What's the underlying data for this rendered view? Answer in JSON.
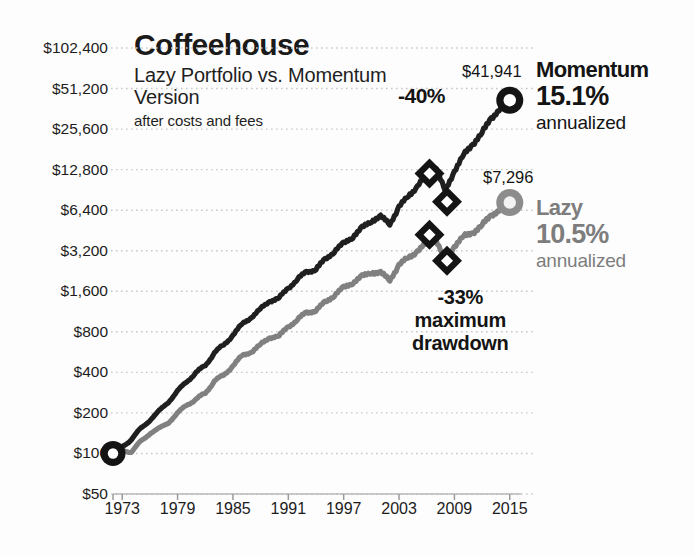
{
  "chart_data": {
    "type": "line",
    "title": "Coffeehouse",
    "subtitle": "Lazy Portfolio vs. Momentum Version",
    "note": "after costs and fees",
    "xlabel": "",
    "ylabel": "",
    "yscale": "log2",
    "ylim": [
      50,
      102400
    ],
    "xlim": [
      1972,
      2016
    ],
    "grid": true,
    "legend_position": "right",
    "y_tick_labels": [
      "$102,400",
      "$51,200",
      "$25,600",
      "$12,800",
      "$6,400",
      "$3,200",
      "$1,600",
      "$800",
      "$400",
      "$200",
      "$100",
      "$50"
    ],
    "y_tick_values": [
      102400,
      51200,
      25600,
      12800,
      6400,
      3200,
      1600,
      800,
      400,
      200,
      100,
      50
    ],
    "x_tick_labels": [
      "1973",
      "1979",
      "1985",
      "1991",
      "1997",
      "2003",
      "2009",
      "2015"
    ],
    "x_tick_values": [
      1973,
      1979,
      1985,
      1991,
      1997,
      2003,
      2009,
      2015
    ],
    "series": [
      {
        "name": "Momentum",
        "color": "#1f1f1f",
        "annualized": "15.1%",
        "end_value_label": "$41,941",
        "end_value": 41941,
        "start_value": 100,
        "max_drawdown_label": "-40%",
        "x": [
          1972,
          1973,
          1974,
          1975,
          1976,
          1977,
          1978,
          1979,
          1980,
          1981,
          1982,
          1983,
          1984,
          1985,
          1986,
          1987,
          1988,
          1989,
          1990,
          1991,
          1992,
          1993,
          1994,
          1995,
          1996,
          1997,
          1998,
          1999,
          2000,
          2001,
          2002,
          2003,
          2004,
          2005,
          2006,
          2007,
          2008,
          2009,
          2010,
          2011,
          2012,
          2013,
          2014,
          2015
        ],
        "values": [
          100,
          112,
          128,
          152,
          178,
          205,
          243,
          288,
          345,
          395,
          452,
          560,
          638,
          760,
          910,
          1030,
          1180,
          1360,
          1420,
          1700,
          1960,
          2240,
          2330,
          2760,
          3180,
          3620,
          4080,
          4720,
          5350,
          5700,
          5100,
          6700,
          8200,
          9600,
          11800,
          13000,
          8900,
          12500,
          16500,
          19800,
          24000,
          31000,
          36500,
          41941
        ]
      },
      {
        "name": "Lazy",
        "color": "#808080",
        "annualized": "10.5%",
        "end_value_label": "$7,296",
        "end_value": 7296,
        "start_value": 100,
        "max_drawdown_label": "-33%",
        "x": [
          1972,
          1973,
          1974,
          1975,
          1976,
          1977,
          1978,
          1979,
          1980,
          1981,
          1982,
          1983,
          1984,
          1985,
          1986,
          1987,
          1988,
          1989,
          1990,
          1991,
          1992,
          1993,
          1994,
          1995,
          1996,
          1997,
          1998,
          1999,
          2000,
          2001,
          2002,
          2003,
          2004,
          2005,
          2006,
          2007,
          2008,
          2009,
          2010,
          2011,
          2012,
          2013,
          2014,
          2015
        ],
        "values": [
          100,
          106,
          103,
          122,
          142,
          152,
          171,
          197,
          232,
          250,
          282,
          345,
          380,
          450,
          530,
          570,
          640,
          730,
          740,
          880,
          980,
          1120,
          1150,
          1330,
          1500,
          1700,
          1860,
          2060,
          2220,
          2180,
          1960,
          2480,
          2880,
          3150,
          3650,
          3850,
          2680,
          3450,
          4100,
          4350,
          4950,
          5900,
          6500,
          7296
        ]
      }
    ],
    "annotations": [
      {
        "id": "momentum-drawdown",
        "text": "-40%",
        "marker": "diamond-pair",
        "series": "Momentum"
      },
      {
        "id": "lazy-drawdown",
        "line1": "-33%",
        "line2": "maximum",
        "line3": "drawdown",
        "marker": "diamond-pair",
        "series": "Lazy"
      }
    ]
  },
  "legend": {
    "momentum": {
      "name": "Momentum",
      "value": "15.1%",
      "unit": "annualized"
    },
    "lazy": {
      "name": "Lazy",
      "value": "10.5%",
      "unit": "annualized"
    }
  }
}
